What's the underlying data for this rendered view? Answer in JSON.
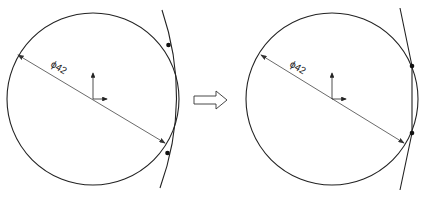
{
  "figure": {
    "panels": [
      {
        "id": "before",
        "dimension_label": "ϕ42",
        "circle": {
          "cx": 93,
          "cy": 99,
          "r": 86
        },
        "curve": "M162,10 Q192,99 160,188",
        "points": [
          [
            168.5,
            45
          ],
          [
            167.5,
            153
          ]
        ],
        "dim_line": {
          "x1": 17,
          "y1": 55,
          "x2": 165,
          "y2": 143
        },
        "label_pos": {
          "x": 52,
          "y": 68
        }
      },
      {
        "id": "after",
        "dimension_label": "ϕ42",
        "circle": {
          "cx": 332,
          "cy": 99,
          "r": 86
        },
        "line_path": "M400,8 L412,66 L412,133 L400,190",
        "points": [
          [
            412,
            66
          ],
          [
            412,
            133
          ]
        ],
        "dim_line": {
          "x1": 260,
          "y1": 55,
          "x2": 404,
          "y2": 143
        },
        "label_pos": {
          "x": 290,
          "y": 68
        }
      }
    ],
    "transition_arrow": "⇒",
    "colors": {
      "stroke": "#222222",
      "dim": "#444444",
      "background": "#ffffff"
    }
  }
}
